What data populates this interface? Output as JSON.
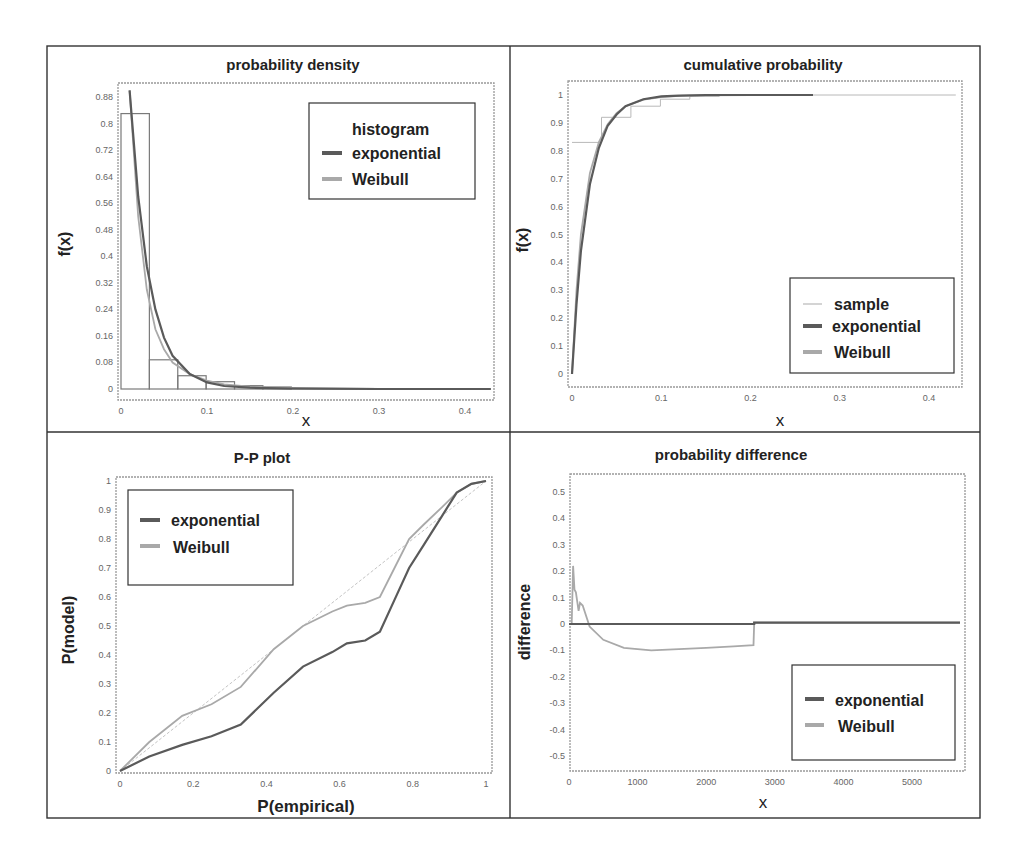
{
  "colors": {
    "exponential": "#5a5a5a",
    "weibull": "#a9a9a9",
    "sample": "#b8b8b8",
    "histogram": "#7a7a7a",
    "reference": "#c4c4c4"
  },
  "chart_data": [
    {
      "id": "pdf",
      "type": "line",
      "title": "probability density",
      "xlabel": "x",
      "ylabel": "f(x)",
      "xlim": [
        0,
        0.43
      ],
      "ylim": [
        0,
        0.9
      ],
      "xticks": [
        "0",
        "0.1",
        "0.2",
        "0.3",
        "0.4"
      ],
      "yticks": [
        "0",
        "0.08",
        "0.16",
        "0.24",
        "0.32",
        "0.4",
        "0.48",
        "0.56",
        "0.64",
        "0.72",
        "0.8",
        "0.88"
      ],
      "grid": false,
      "legend_position": "upper right",
      "legend": [
        "histogram",
        "exponential",
        "Weibull"
      ],
      "histogram": {
        "bin_edges": [
          0,
          0.033,
          0.066,
          0.099,
          0.132,
          0.165,
          0.198
        ],
        "heights": [
          0.83,
          0.088,
          0.04,
          0.022,
          0.01,
          0.006
        ]
      },
      "series": [
        {
          "name": "exponential",
          "x": [
            0.01,
            0.02,
            0.03,
            0.04,
            0.05,
            0.06,
            0.08,
            0.1,
            0.12,
            0.15,
            0.2,
            0.3,
            0.43
          ],
          "values": [
            0.9,
            0.58,
            0.37,
            0.24,
            0.155,
            0.1,
            0.045,
            0.02,
            0.009,
            0.004,
            0.001,
            0,
            0
          ]
        },
        {
          "name": "Weibull",
          "x": [
            0.01,
            0.02,
            0.03,
            0.04,
            0.05,
            0.06,
            0.08,
            0.1,
            0.12,
            0.15,
            0.2,
            0.3,
            0.43
          ],
          "values": [
            0.9,
            0.52,
            0.3,
            0.18,
            0.12,
            0.08,
            0.045,
            0.025,
            0.014,
            0.007,
            0.003,
            0,
            0
          ]
        }
      ]
    },
    {
      "id": "cdf",
      "type": "line",
      "title": "cumulative probability",
      "xlabel": "x",
      "ylabel": "f(x)",
      "xlim": [
        0,
        0.43
      ],
      "ylim": [
        -0.03,
        1.05
      ],
      "xticks": [
        "0",
        "0.1",
        "0.2",
        "0.3",
        "0.4"
      ],
      "yticks": [
        "0",
        "0.1",
        "0.2",
        "0.3",
        "0.4",
        "0.5",
        "0.6",
        "0.7",
        "0.8",
        "0.9",
        "1"
      ],
      "grid": false,
      "legend_position": "lower right",
      "legend": [
        "sample",
        "exponential",
        "Weibull"
      ],
      "series": [
        {
          "name": "sample",
          "type": "step",
          "x": [
            0,
            0.033,
            0.066,
            0.099,
            0.132,
            0.165,
            0.43
          ],
          "values": [
            0.83,
            0.92,
            0.96,
            0.985,
            0.995,
            1,
            1
          ]
        },
        {
          "name": "exponential",
          "x": [
            0,
            0.005,
            0.01,
            0.02,
            0.03,
            0.04,
            0.05,
            0.06,
            0.08,
            0.1,
            0.12,
            0.15,
            0.2,
            0.27
          ],
          "values": [
            0,
            0.25,
            0.44,
            0.68,
            0.81,
            0.89,
            0.93,
            0.96,
            0.985,
            0.995,
            0.998,
            1,
            1,
            1
          ]
        },
        {
          "name": "Weibull",
          "x": [
            0,
            0.005,
            0.01,
            0.02,
            0.03,
            0.04,
            0.05,
            0.06,
            0.08,
            0.1,
            0.12,
            0.15,
            0.2,
            0.27
          ],
          "values": [
            0,
            0.3,
            0.5,
            0.72,
            0.83,
            0.895,
            0.935,
            0.96,
            0.983,
            0.993,
            0.997,
            0.999,
            1,
            1
          ]
        }
      ]
    },
    {
      "id": "pp",
      "type": "line",
      "title": "P-P plot",
      "xlabel": "P(empirical)",
      "ylabel": "P(model)",
      "xlim": [
        0,
        1
      ],
      "ylim": [
        0,
        1
      ],
      "xticks": [
        "0",
        "0.2",
        "0.4",
        "0.6",
        "0.8",
        "1"
      ],
      "yticks": [
        "0",
        "0.1",
        "0.2",
        "0.3",
        "0.4",
        "0.5",
        "0.6",
        "0.7",
        "0.8",
        "0.9",
        "1"
      ],
      "grid": false,
      "legend_position": "upper left",
      "legend": [
        "exponential",
        "Weibull"
      ],
      "series": [
        {
          "name": "exponential",
          "x": [
            0,
            0.08,
            0.17,
            0.25,
            0.33,
            0.42,
            0.5,
            0.58,
            0.62,
            0.67,
            0.71,
            0.75,
            0.79,
            0.83,
            0.88,
            0.92,
            0.96,
            1
          ],
          "values": [
            0,
            0.05,
            0.09,
            0.12,
            0.16,
            0.27,
            0.36,
            0.41,
            0.44,
            0.45,
            0.48,
            0.59,
            0.7,
            0.78,
            0.88,
            0.96,
            0.99,
            1
          ]
        },
        {
          "name": "Weibull",
          "x": [
            0,
            0.08,
            0.17,
            0.25,
            0.33,
            0.42,
            0.5,
            0.58,
            0.62,
            0.67,
            0.71,
            0.75,
            0.79,
            0.83,
            0.88,
            0.92,
            0.96,
            1
          ],
          "values": [
            0,
            0.1,
            0.19,
            0.23,
            0.29,
            0.42,
            0.5,
            0.55,
            0.57,
            0.58,
            0.6,
            0.7,
            0.8,
            0.85,
            0.91,
            0.96,
            0.99,
            1
          ]
        },
        {
          "name": "reference",
          "x": [
            0,
            1
          ],
          "values": [
            0,
            1
          ]
        }
      ]
    },
    {
      "id": "diff",
      "type": "line",
      "title": "probability difference",
      "xlabel": "x",
      "ylabel": "difference",
      "xlim": [
        0,
        5750
      ],
      "ylim": [
        -0.55,
        0.55
      ],
      "xticks": [
        "0",
        "1000",
        "2000",
        "3000",
        "4000",
        "5000"
      ],
      "yticks": [
        "0.5",
        "0.4",
        "0.3",
        "0.2",
        "0.1",
        "0",
        "-0.1",
        "-0.2",
        "-0.3",
        "-0.4",
        "-0.5"
      ],
      "grid": false,
      "legend_position": "lower right",
      "legend": [
        "exponential",
        "Weibull"
      ],
      "series": [
        {
          "name": "exponential",
          "x": [
            0,
            2700,
            2700,
            5700
          ],
          "values": [
            0,
            0,
            0.005,
            0.005
          ]
        },
        {
          "name": "Weibull",
          "x": [
            40,
            60,
            80,
            100,
            140,
            160,
            200,
            300,
            500,
            800,
            1200,
            1600,
            2000,
            2400,
            2690,
            2700,
            5700
          ],
          "values": [
            0,
            0.22,
            0.13,
            0.12,
            0.05,
            0.08,
            0.07,
            -0.01,
            -0.06,
            -0.09,
            -0.1,
            -0.095,
            -0.09,
            -0.085,
            -0.08,
            0.005,
            0.005
          ]
        }
      ]
    }
  ]
}
